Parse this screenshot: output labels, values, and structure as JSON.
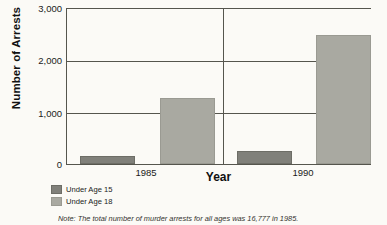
{
  "chart_data": {
    "type": "bar",
    "title": "",
    "xlabel": "Year",
    "ylabel": "Number of Arrests",
    "categories": [
      "1985",
      "1990"
    ],
    "series": [
      {
        "name": "Under Age 15",
        "values": [
          150,
          250
        ],
        "color": "#80807a"
      },
      {
        "name": "Under Age 18",
        "values": [
          1270,
          2500
        ],
        "color": "#a9a9a1"
      }
    ],
    "ylim": [
      0,
      3000
    ],
    "yticks": [
      0,
      1000,
      2000,
      3000
    ],
    "ytick_labels": [
      "0",
      "1,000",
      "2,000",
      "3,000"
    ],
    "grid": "horizontal-at-1000-and-2000 plus vertical group divider",
    "legend_position": "below-left",
    "note": "Note:  The total number of murder arrests for all ages was 16,777 in 1985."
  },
  "axes": {
    "y_title": "Number of Arrests",
    "x_title": "Year",
    "y_ticks": [
      {
        "label": "3,000",
        "value": 3000
      },
      {
        "label": "2,000",
        "value": 2000
      },
      {
        "label": "1,000",
        "value": 1000
      },
      {
        "label": "0",
        "value": 0
      }
    ],
    "x_ticks": [
      {
        "label": "1985"
      },
      {
        "label": "1990"
      }
    ]
  },
  "legend": {
    "items": [
      {
        "label": "Under Age 15",
        "color": "#80807a"
      },
      {
        "label": "Under Age 18",
        "color": "#a9a9a1"
      }
    ]
  },
  "footnote": {
    "text": "Note:  The total number of murder arrests for all ages was 16,777 in 1985."
  },
  "colors": {
    "series_under_15": "#80807a",
    "series_under_18": "#a9a9a1",
    "axis": "#55554d",
    "background": "#fbfaf6"
  }
}
